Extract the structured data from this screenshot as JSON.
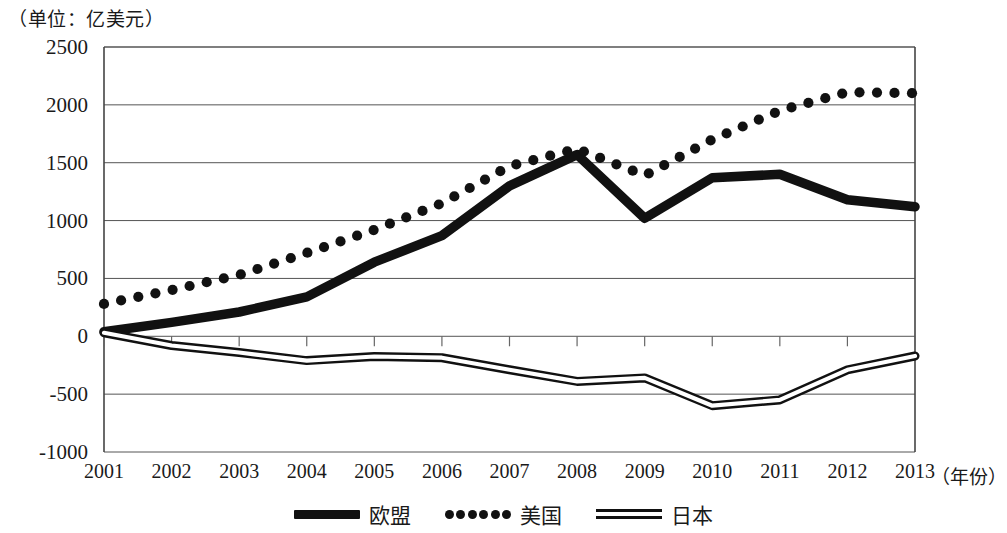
{
  "unit_label": "（单位：亿美元）",
  "axis": {
    "x_title": "（年份）",
    "y_ticks": [
      "2500",
      "2000",
      "1500",
      "1000",
      "500",
      "0",
      "-500",
      "-1000"
    ],
    "x_ticks": [
      "2001",
      "2002",
      "2003",
      "2004",
      "2005",
      "2006",
      "2007",
      "2008",
      "2009",
      "2010",
      "2011",
      "2012",
      "2013"
    ]
  },
  "legend": {
    "items": [
      {
        "label": "欧盟",
        "style": "solid-thick",
        "color": "#111111"
      },
      {
        "label": "美国",
        "style": "dotted",
        "color": "#111111"
      },
      {
        "label": "日本",
        "style": "double-line",
        "color": "#111111"
      }
    ]
  },
  "chart_data": {
    "type": "line",
    "title": "",
    "subtitle": "",
    "xlabel": "（年份）",
    "ylabel": "（单位：亿美元）",
    "x": [
      "2001",
      "2002",
      "2003",
      "2004",
      "2005",
      "2006",
      "2007",
      "2008",
      "2009",
      "2010",
      "2011",
      "2012",
      "2013"
    ],
    "categories": [
      "2001",
      "2002",
      "2003",
      "2004",
      "2005",
      "2006",
      "2007",
      "2008",
      "2009",
      "2010",
      "2011",
      "2012",
      "2013"
    ],
    "ylim": [
      -1000,
      2500
    ],
    "ytick_values": [
      2500,
      2000,
      1500,
      1000,
      500,
      0,
      -500,
      -1000
    ],
    "grid": true,
    "legend_position": "bottom",
    "series": [
      {
        "name": "欧盟",
        "style": "solid-thick",
        "color": "#111111",
        "values": [
          40,
          120,
          210,
          340,
          640,
          870,
          1300,
          1570,
          1020,
          1370,
          1400,
          1180,
          1120
        ]
      },
      {
        "name": "美国",
        "style": "dotted",
        "color": "#111111",
        "values": [
          280,
          400,
          530,
          720,
          920,
          1150,
          1470,
          1620,
          1390,
          1700,
          1950,
          2110,
          2100
        ]
      },
      {
        "name": "日本",
        "style": "double-line",
        "color": "#111111",
        "values": [
          30,
          -80,
          -140,
          -210,
          -175,
          -185,
          -290,
          -390,
          -360,
          -600,
          -550,
          -290,
          -170
        ]
      }
    ]
  }
}
